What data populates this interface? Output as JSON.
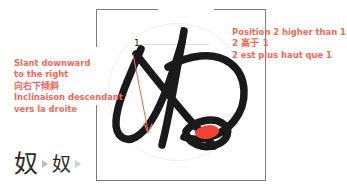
{
  "character": {
    "glyph": "奴",
    "stroke_numbers": [
      "1",
      "2"
    ]
  },
  "annotations": {
    "left": {
      "name": "slant-annotation",
      "lines": [
        "Slant downward",
        "to the right",
        "向右下倾斜",
        "Inclinaison descendant",
        "vers la droite"
      ],
      "cjk_line_index": 2,
      "color": "#ec6a59"
    },
    "right": {
      "name": "position-annotation",
      "lines": [
        "Position 2 higher than 1",
        "2 高于 1",
        "2 est plus haut que 1"
      ],
      "cjk_line_index": 1,
      "color": "#ec6a59"
    }
  },
  "glyph_strip": {
    "items": [
      {
        "type": "character",
        "value": "奴",
        "size": "large"
      },
      {
        "type": "separator",
        "value": "▶"
      },
      {
        "type": "character",
        "value": "奴",
        "size": "small"
      },
      {
        "type": "separator",
        "value": "▶"
      }
    ]
  },
  "colors": {
    "annotation_red": "#ec6a59",
    "stroke_black": "#1a1a1a",
    "frame_gray": "#7c7c7c",
    "guide_gray": "#f0eeec",
    "highlight_red": "#ee4433"
  }
}
